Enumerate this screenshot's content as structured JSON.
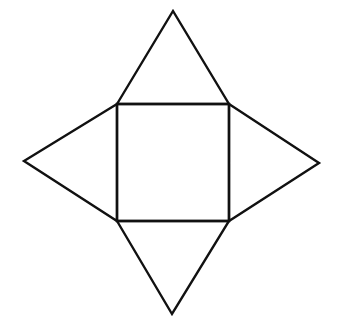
{
  "diagram": {
    "type": "square-pyramid-net",
    "stroke_color": "#111111",
    "background": "#ffffff",
    "stroke_width": 2.4,
    "square": {
      "x1": 117,
      "y1": 104,
      "x2": 229,
      "y2": 221
    },
    "triangles": [
      {
        "name": "top",
        "points": "117,104 173,11 229,104"
      },
      {
        "name": "left",
        "points": "117,104 24,161 117,221"
      },
      {
        "name": "right",
        "points": "229,104 319,163 229,221"
      },
      {
        "name": "bottom",
        "points": "117,221 172,314 229,221"
      }
    ]
  }
}
